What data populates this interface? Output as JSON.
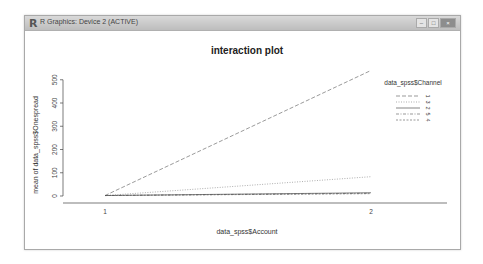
{
  "window": {
    "title": "R Graphics: Device 2 (ACTIVE)",
    "icon": "r-logo-icon",
    "buttons": {
      "minimize": "–",
      "maximize": "□",
      "close": "×"
    }
  },
  "chart_data": {
    "type": "line",
    "title": "interaction plot",
    "xlabel": "data_spss$Account",
    "ylabel": "mean of  data_spss$Onespread",
    "x": [
      "1",
      "2"
    ],
    "yticks": [
      0,
      100,
      200,
      300,
      400,
      500
    ],
    "ylim": [
      0,
      560
    ],
    "legend_title": "data_spss$Channel",
    "legend_position": "right",
    "grid": false,
    "series": [
      {
        "name": "1",
        "values": [
          2,
          540
        ],
        "dash": "4,2",
        "color": "#555555"
      },
      {
        "name": "3",
        "values": [
          2,
          83
        ],
        "dash": "1,1.5",
        "color": "#777777"
      },
      {
        "name": "2",
        "values": [
          2,
          14
        ],
        "dash": "",
        "color": "#333333"
      },
      {
        "name": "5",
        "values": [
          2,
          12
        ],
        "dash": "3,1.5,1,1.5",
        "color": "#555555"
      },
      {
        "name": "4",
        "values": [
          2,
          10
        ],
        "dash": "2,1.5",
        "color": "#555555"
      }
    ]
  }
}
